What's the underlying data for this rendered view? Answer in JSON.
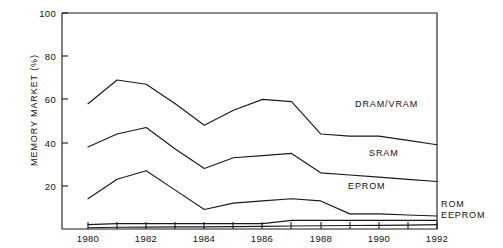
{
  "chart_data": {
    "type": "area",
    "title": "",
    "subtitle": "",
    "xlabel": "",
    "ylabel": "MEMORY MARKET (%)",
    "xlim": [
      1979,
      1992
    ],
    "ylim": [
      0,
      100
    ],
    "grid": false,
    "legend_position": "inline-right",
    "stacked": true,
    "note": "Cumulative boundary lines; each series value is its own share, boundaries are running totals from the bottom (EEPROM, ROM, EPROM, SRAM, DRAM/VRAM).",
    "x": [
      1980,
      1981,
      1982,
      1983,
      1984,
      1985,
      1986,
      1987,
      1988,
      1989,
      1990,
      1991,
      1992
    ],
    "xticks": [
      1980,
      1982,
      1984,
      1986,
      1988,
      1990,
      1992
    ],
    "xtick_labels": [
      "1980",
      "1982",
      "1984",
      "1986",
      "1988",
      "1990",
      "1992"
    ],
    "yticks": [
      20,
      40,
      60,
      80,
      100
    ],
    "ytick_labels": [
      "20",
      "40",
      "60",
      "80",
      "100"
    ],
    "boundaries": [
      {
        "name": "DRAM/VRAM",
        "label": "DRAM/VRAM",
        "cumulative_values": [
          58,
          69,
          67,
          58,
          48,
          55,
          60,
          59,
          44,
          43,
          43,
          41,
          39
        ]
      },
      {
        "name": "SRAM",
        "label": "SRAM",
        "cumulative_values": [
          38,
          44,
          47,
          37,
          28,
          33,
          34,
          35,
          26,
          25,
          24,
          23,
          22
        ]
      },
      {
        "name": "EPROM",
        "label": "EPROM",
        "cumulative_values": [
          14,
          23,
          27,
          18,
          9,
          12,
          13,
          14,
          13,
          7,
          7,
          6.5,
          6
        ]
      },
      {
        "name": "ROM",
        "label": "ROM",
        "cumulative_values": [
          2,
          2.5,
          2.5,
          2.5,
          2.5,
          2.5,
          2.5,
          4,
          4,
          4,
          4,
          4,
          4
        ]
      },
      {
        "name": "EEPROM",
        "label": "EEPROM",
        "cumulative_values": [
          0.6,
          0.8,
          0.9,
          1,
          1,
          1.1,
          1.2,
          1.4,
          1.5,
          1.6,
          1.7,
          1.8,
          2
        ]
      }
    ],
    "series": [
      {
        "name": "DRAM/VRAM",
        "values": [
          20,
          25,
          20,
          21,
          20,
          22,
          26,
          24,
          18,
          18,
          19,
          18,
          17
        ]
      },
      {
        "name": "SRAM",
        "values": [
          24,
          21,
          20,
          19,
          19,
          21,
          21,
          21,
          13,
          18,
          17,
          16.5,
          16
        ]
      },
      {
        "name": "EPROM",
        "values": [
          12,
          20.5,
          24.5,
          15.5,
          6.5,
          9.5,
          10.5,
          10,
          9,
          3,
          3,
          2.5,
          2
        ]
      },
      {
        "name": "ROM",
        "values": [
          1.4,
          1.7,
          1.6,
          1.5,
          1.5,
          1.4,
          1.3,
          2.6,
          2.5,
          2.4,
          2.3,
          2.2,
          2
        ]
      },
      {
        "name": "EEPROM",
        "values": [
          0.6,
          0.8,
          0.9,
          1,
          1,
          1.1,
          1.2,
          1.4,
          1.5,
          1.6,
          1.7,
          1.8,
          2
        ]
      }
    ],
    "annotations": [
      {
        "text": "DRAM/VRAM",
        "x": 1990.1,
        "y": 52,
        "placement": "inside"
      },
      {
        "text": "SRAM",
        "x": 1990.4,
        "y": 30,
        "placement": "inside"
      },
      {
        "text": "EPROM",
        "x": 1989.7,
        "y": 16,
        "placement": "inside"
      },
      {
        "text": "ROM",
        "x": 1992.4,
        "y": 6,
        "placement": "outside-right"
      },
      {
        "text": "EEPROM",
        "x": 1992.4,
        "y": 1.5,
        "placement": "outside-right"
      }
    ]
  },
  "axis_colors": {
    "line": "#1a1a1a",
    "text": "#111111",
    "background": "#ffffff"
  }
}
